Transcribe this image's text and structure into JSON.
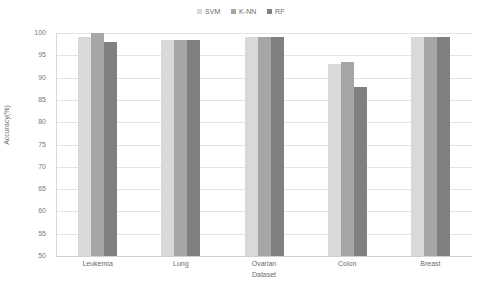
{
  "chart_data": {
    "type": "bar",
    "title": "",
    "xlabel": "Dataset",
    "ylabel": "Accuracy(%)",
    "categories": [
      "Leukemia",
      "Lung",
      "Ovarian",
      "Colon",
      "Breast"
    ],
    "ylim": [
      50,
      100
    ],
    "yticks": [
      100,
      95,
      90,
      85,
      80,
      75,
      70,
      65,
      60,
      55,
      50
    ],
    "grid": true,
    "legend_position": "top-center",
    "series": [
      {
        "name": "SVM",
        "color": "#d9d9d9",
        "values": [
          99.0,
          98.5,
          99.0,
          93.0,
          99.0
        ]
      },
      {
        "name": "K-NN",
        "color": "#a6a6a6",
        "values": [
          100.0,
          98.5,
          99.2,
          93.5,
          99.2
        ]
      },
      {
        "name": "RF",
        "color": "#808080",
        "values": [
          98.0,
          98.5,
          99.0,
          88.0,
          99.0
        ]
      }
    ]
  }
}
